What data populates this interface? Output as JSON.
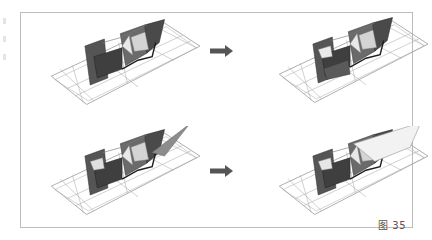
{
  "figure": {
    "caption": "图 35",
    "layout": "2x2 grid of 3D wireframe architectural models with transformation arrows",
    "panels": [
      {
        "id": "top-left",
        "description": "wireframe folded surface model, initial state"
      },
      {
        "id": "top-right",
        "description": "wireframe folded surface model, transformed state"
      },
      {
        "id": "bottom-left",
        "description": "wireframe folded surface model with spike, initial state"
      },
      {
        "id": "bottom-right",
        "description": "wireframe folded surface model with raised plane, transformed state"
      }
    ],
    "arrows": [
      {
        "row": 1,
        "direction": "right"
      },
      {
        "row": 2,
        "direction": "right"
      }
    ]
  },
  "colors": {
    "frame": "#bdbdbd",
    "wire": "#9a9a9a",
    "dark_face": "#4a4a4a",
    "mid_face": "#6e6e6e",
    "light_face": "#cfcfcf",
    "arrow": "#555555"
  }
}
